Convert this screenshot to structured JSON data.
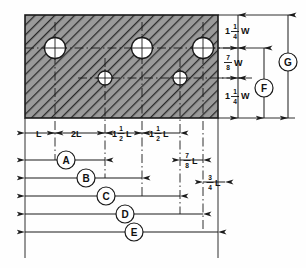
{
  "drawing": {
    "title": "Plate hole layout dimensioned drawing",
    "plate": {
      "name": "hatched-plate",
      "fill_style": "diagonal-hatch",
      "hatch_color": "#8a8a8a",
      "outline_color": "#1a1a1a"
    },
    "holes": [
      {
        "id": "hole-upper-1",
        "size": "large"
      },
      {
        "id": "hole-upper-2",
        "size": "large"
      },
      {
        "id": "hole-upper-3",
        "size": "large"
      },
      {
        "id": "hole-lower-1",
        "size": "small"
      },
      {
        "id": "hole-lower-2",
        "size": "small"
      }
    ],
    "vertical_dimensions": [
      {
        "id": "dim-top-w",
        "whole": "1",
        "num": "1",
        "den": "4",
        "unit": "W"
      },
      {
        "id": "dim-middle-w",
        "whole": "",
        "num": "7",
        "den": "8",
        "unit": "W"
      },
      {
        "id": "dim-bottom-w",
        "whole": "1",
        "num": "1",
        "den": "4",
        "unit": "W"
      }
    ],
    "horizontal_dimensions": [
      {
        "id": "dim-l",
        "whole": "L",
        "num": "",
        "den": "",
        "unit": ""
      },
      {
        "id": "dim-2l",
        "whole": "2L",
        "num": "",
        "den": "",
        "unit": ""
      },
      {
        "id": "dim-1-1-2-l-a",
        "whole": "1",
        "num": "1",
        "den": "2",
        "unit": "L"
      },
      {
        "id": "dim-1-1-2-l-b",
        "whole": "1",
        "num": "1",
        "den": "2",
        "unit": "L"
      },
      {
        "id": "dim-7-8-l",
        "whole": "",
        "num": "7",
        "den": "8",
        "unit": "L"
      },
      {
        "id": "dim-3-4-l",
        "whole": "",
        "num": "3",
        "den": "4",
        "unit": "L"
      }
    ],
    "balloons": [
      {
        "id": "balloon-a",
        "label": "A"
      },
      {
        "id": "balloon-b",
        "label": "B"
      },
      {
        "id": "balloon-c",
        "label": "C"
      },
      {
        "id": "balloon-d",
        "label": "D"
      },
      {
        "id": "balloon-e",
        "label": "E"
      },
      {
        "id": "balloon-f",
        "label": "F"
      },
      {
        "id": "balloon-g",
        "label": "G"
      }
    ]
  }
}
